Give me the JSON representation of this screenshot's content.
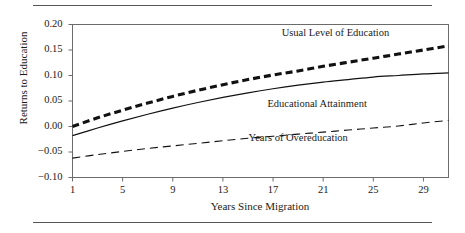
{
  "figure": {
    "has_top_rule": true,
    "has_bottom_rule": true,
    "background": "#ffffff",
    "ink_color": "#1a1a1a"
  },
  "chart_data": {
    "type": "line",
    "title": "",
    "xlabel": "Years Since Migration",
    "ylabel": "Returns to Education",
    "xlim": [
      1,
      31
    ],
    "ylim": [
      -0.1,
      0.2
    ],
    "grid": false,
    "legend": "inline-annotations",
    "xticks": [
      1,
      5,
      9,
      13,
      17,
      21,
      25,
      29
    ],
    "xticklabels": [
      "1",
      "5",
      "9",
      "13",
      "17",
      "21",
      "25",
      "29"
    ],
    "yticks": [
      -0.1,
      -0.05,
      0.0,
      0.05,
      0.1,
      0.15,
      0.2
    ],
    "yticklabels": [
      "−0.10",
      "−0.05",
      "0.00",
      "0.05",
      "0.10",
      "0.15",
      "0.20"
    ],
    "x": [
      1,
      3,
      5,
      7,
      9,
      11,
      13,
      15,
      17,
      19,
      21,
      23,
      25,
      27,
      29,
      31
    ],
    "series": [
      {
        "name": "Usual Level of Education",
        "style": "thick-dashed",
        "color": "#111111",
        "width": 3.1,
        "dash": "7,4",
        "label_x": 22.0,
        "label_y": 0.182,
        "values": [
          0.0,
          0.017,
          0.032,
          0.046,
          0.059,
          0.071,
          0.082,
          0.092,
          0.101,
          0.109,
          0.118,
          0.126,
          0.134,
          0.142,
          0.15,
          0.158
        ]
      },
      {
        "name": "Educational Attainment",
        "style": "solid",
        "color": "#111111",
        "width": 1.2,
        "dash": "none",
        "label_x": 20.5,
        "label_y": 0.043,
        "values": [
          -0.018,
          -0.003,
          0.011,
          0.024,
          0.036,
          0.047,
          0.057,
          0.066,
          0.074,
          0.081,
          0.087,
          0.092,
          0.097,
          0.1,
          0.103,
          0.105
        ]
      },
      {
        "name": "Years of Overeducation",
        "style": "thin-dashed",
        "color": "#111111",
        "width": 1.1,
        "dash": "8,5",
        "label_x": 19.0,
        "label_y": -0.024,
        "values": [
          -0.062,
          -0.055,
          -0.049,
          -0.043,
          -0.038,
          -0.033,
          -0.028,
          -0.023,
          -0.019,
          -0.015,
          -0.011,
          -0.007,
          -0.003,
          0.001,
          0.007,
          0.012
        ]
      }
    ]
  }
}
